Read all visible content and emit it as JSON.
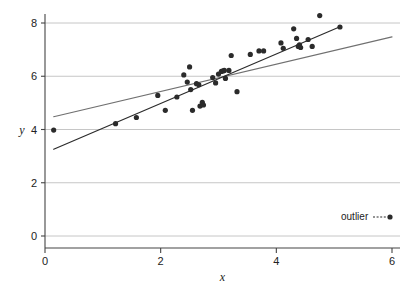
{
  "chart_data": {
    "type": "scatter",
    "title": "",
    "xlabel": "x",
    "ylabel": "y",
    "xlim": [
      0,
      6
    ],
    "ylim": [
      0,
      8.6
    ],
    "xticks": [
      0,
      2,
      4,
      6
    ],
    "xtick_labels": [
      "0",
      "2",
      "4",
      "6"
    ],
    "yticks": [
      0,
      2,
      4,
      6,
      8
    ],
    "ytick_labels": [
      "0",
      "2",
      "4",
      "6",
      "8"
    ],
    "grid": "horizontal",
    "grid_color": "#b8b8b8",
    "axis_color": "#444444",
    "marker_color": "#2b2b2b",
    "marker_size": 4,
    "legend": {
      "position": "bottom-right",
      "entries": [
        {
          "label": "outlier",
          "line_style": "dashed",
          "marker": "circle",
          "color": "#2b2b2b"
        }
      ]
    },
    "series": [
      {
        "name": "points",
        "type": "scatter",
        "color": "#2b2b2b",
        "points": [
          [
            0.15,
            3.98
          ],
          [
            1.22,
            4.22
          ],
          [
            1.58,
            4.45
          ],
          [
            1.95,
            5.28
          ],
          [
            2.08,
            4.72
          ],
          [
            2.28,
            5.22
          ],
          [
            2.4,
            6.05
          ],
          [
            2.46,
            5.78
          ],
          [
            2.5,
            6.35
          ],
          [
            2.52,
            5.5
          ],
          [
            2.55,
            4.72
          ],
          [
            2.62,
            5.72
          ],
          [
            2.66,
            5.68
          ],
          [
            2.68,
            4.88
          ],
          [
            2.72,
            5.02
          ],
          [
            2.74,
            4.92
          ],
          [
            2.9,
            5.95
          ],
          [
            2.95,
            5.75
          ],
          [
            3.0,
            6.08
          ],
          [
            3.05,
            6.18
          ],
          [
            3.08,
            6.2
          ],
          [
            3.1,
            6.22
          ],
          [
            3.12,
            5.92
          ],
          [
            3.18,
            6.22
          ],
          [
            3.22,
            6.78
          ],
          [
            3.32,
            5.42
          ],
          [
            3.55,
            6.82
          ],
          [
            3.7,
            6.95
          ],
          [
            3.78,
            6.95
          ],
          [
            4.08,
            7.25
          ],
          [
            4.12,
            7.05
          ],
          [
            4.3,
            7.78
          ],
          [
            4.35,
            7.42
          ],
          [
            4.38,
            7.12
          ],
          [
            4.4,
            7.18
          ],
          [
            4.42,
            7.08
          ],
          [
            4.55,
            7.38
          ],
          [
            4.62,
            7.12
          ],
          [
            4.75,
            8.28
          ],
          [
            5.1,
            7.85
          ]
        ]
      }
    ],
    "lines": [
      {
        "name": "fit-with-outlier",
        "style": "solid",
        "color": "#707070",
        "width": 1.2,
        "x0": 0.15,
        "y0": 4.48,
        "x1": 6.0,
        "y1": 7.48
      },
      {
        "name": "fit-without-outlier",
        "style": "solid",
        "color": "#2b2b2b",
        "width": 1.2,
        "x0": 0.15,
        "y0": 3.26,
        "x1": 5.12,
        "y1": 7.88
      }
    ]
  }
}
